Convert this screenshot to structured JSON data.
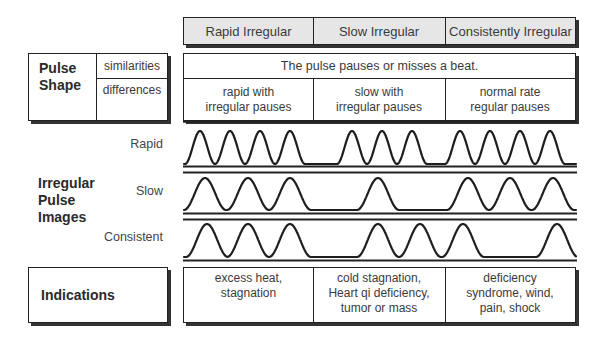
{
  "columns": [
    "Rapid Irregular",
    "Slow Irregular",
    "Consistently Irregular"
  ],
  "pulse_shape": {
    "title_line1": "Pulse",
    "title_line2": "Shape",
    "similarities_label": "similarities",
    "differences_label": "differences",
    "similarities_text": "The pulse pauses or misses a beat.",
    "differences": [
      {
        "line1": "rapid with",
        "line2": "irregular pauses"
      },
      {
        "line1": "slow with",
        "line2": "irregular pauses"
      },
      {
        "line1": "normal rate",
        "line2": "regular pauses"
      }
    ]
  },
  "images": {
    "title_line1": "Irregular",
    "title_line2": "Pulse",
    "title_line3": "Images",
    "rows": [
      {
        "label": "Rapid",
        "peaks": [
          200,
          230,
          260,
          290,
          352,
          382,
          412,
          460,
          490,
          520,
          550
        ],
        "half_width": 15
      },
      {
        "label": "Slow",
        "peaks": [
          205,
          248,
          290,
          378,
          468,
          510,
          553
        ],
        "half_width": 21
      },
      {
        "label": "Consistent",
        "peaks": [
          207,
          248,
          290,
          378,
          420,
          463,
          557
        ],
        "half_width": 21
      }
    ]
  },
  "indications": {
    "title": "Indications",
    "cells": [
      {
        "line1": "excess heat,",
        "line2": "stagnation",
        "line3": ""
      },
      {
        "line1": "cold stagnation,",
        "line2": "Heart qi deficiency,",
        "line3": "tumor or mass"
      },
      {
        "line1": "deficiency",
        "line2": "syndrome, wind,",
        "line3": "pain, shock"
      }
    ]
  }
}
